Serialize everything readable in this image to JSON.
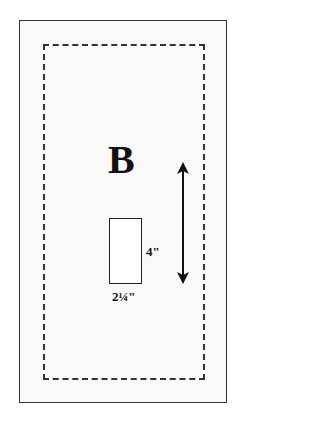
{
  "diagram": {
    "label": "B",
    "pocket": {
      "height_label": "4\"",
      "width_label": "2¼\""
    },
    "arrow": "double-headed-vertical-arrow",
    "colors": {
      "line": "#333333",
      "panel_fill": "#f9f9f9",
      "text": "#111111"
    }
  }
}
